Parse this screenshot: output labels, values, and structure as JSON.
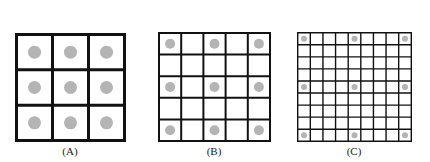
{
  "panels": [
    {
      "id": "A",
      "caption": "(A)",
      "rows": 3,
      "cols": 3,
      "line_width": 3,
      "dot_radius": 6.5,
      "dot_every": 1
    },
    {
      "id": "B",
      "caption": "(B)",
      "rows": 5,
      "cols": 5,
      "line_width": 2,
      "dot_radius": 5,
      "dot_every": 2
    },
    {
      "id": "C",
      "caption": "(C)",
      "rows": 9,
      "cols": 9,
      "line_width": 1.4,
      "dot_radius": 3,
      "dot_every": 4
    }
  ],
  "colors": {
    "line": "#111111",
    "dot": "#b4b4b4",
    "background": "#ffffff"
  }
}
